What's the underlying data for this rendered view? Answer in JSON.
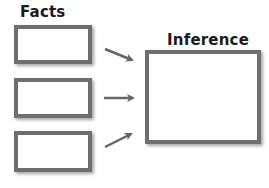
{
  "diagram": {
    "left_heading": "Facts",
    "right_heading": "Inference",
    "fact_boxes": [
      "",
      "",
      ""
    ],
    "inference_box": "",
    "colors": {
      "box_border": "#6e6e6e",
      "arrow": "#666666",
      "text": "#1a1a1a"
    },
    "arrows": [
      {
        "from": "fact-1",
        "to": "inference",
        "direction": "down-right"
      },
      {
        "from": "fact-2",
        "to": "inference",
        "direction": "right"
      },
      {
        "from": "fact-3",
        "to": "inference",
        "direction": "up-right"
      }
    ]
  }
}
